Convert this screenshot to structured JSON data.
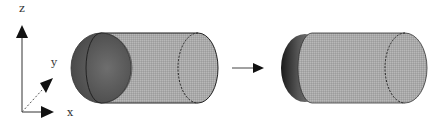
{
  "axes": {
    "z_label": "z",
    "y_label": "y",
    "x_label": "x"
  },
  "figure": {
    "left_shape": "cylinder with hemispherical dark end cap (before)",
    "transition": "arrow",
    "right_shape": "cylinder with flattened blurred end cap (after)"
  },
  "colors": {
    "body_fill": "#a8a8a8",
    "cap_dark": "#5a5a5a",
    "outline": "#222222",
    "arrow": "#111111"
  }
}
